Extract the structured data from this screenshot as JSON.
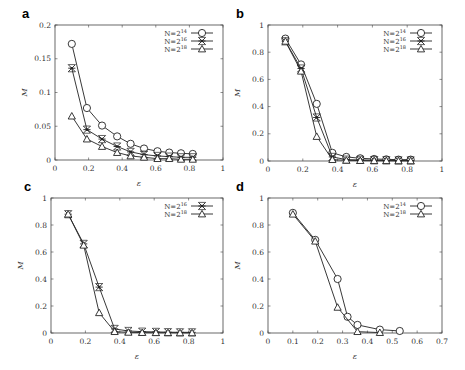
{
  "chart_data": [
    {
      "panel": "a",
      "type": "line",
      "xlabel": "ε",
      "ylabel": "M",
      "xlim": [
        0,
        1
      ],
      "ylim": [
        0,
        0.2
      ],
      "xticks": [
        "0",
        "0.2",
        "0.4",
        "0.6",
        "0.8",
        "1"
      ],
      "yticks": [
        "0",
        "0.05",
        "0.1",
        "0.15",
        "0.2"
      ],
      "legend_position": "top-right",
      "x": [
        0.1,
        0.19,
        0.28,
        0.37,
        0.45,
        0.53,
        0.61,
        0.68,
        0.75,
        0.82
      ],
      "series": [
        {
          "name": "N=2^14",
          "marker": "circle",
          "values": [
            0.172,
            0.077,
            0.051,
            0.035,
            0.024,
            0.017,
            0.013,
            0.011,
            0.01,
            0.009
          ]
        },
        {
          "name": "N=2^16",
          "marker": "asterisk",
          "values": [
            0.136,
            0.045,
            0.031,
            0.02,
            0.012,
            0.008,
            0.006,
            0.005,
            0.004,
            0.004
          ]
        },
        {
          "name": "N=2^18",
          "marker": "triangle",
          "values": [
            0.065,
            0.031,
            0.02,
            0.011,
            0.006,
            0.004,
            0.002,
            0.002,
            0.001,
            0.001
          ]
        }
      ]
    },
    {
      "panel": "b",
      "type": "line",
      "xlabel": "ε",
      "ylabel": "M",
      "xlim": [
        0,
        1
      ],
      "ylim": [
        0,
        1
      ],
      "xticks": [
        "0",
        "0.2",
        "0.4",
        "0.6",
        "0.8",
        "1"
      ],
      "yticks": [
        "0",
        "0.2",
        "0.4",
        "0.6",
        "0.8",
        "1"
      ],
      "legend_position": "top-right",
      "x": [
        0.1,
        0.19,
        0.28,
        0.37,
        0.45,
        0.53,
        0.61,
        0.68,
        0.75,
        0.82
      ],
      "series": [
        {
          "name": "N=2^14",
          "marker": "circle",
          "values": [
            0.9,
            0.71,
            0.42,
            0.06,
            0.03,
            0.02,
            0.015,
            0.012,
            0.01,
            0.01
          ]
        },
        {
          "name": "N=2^16",
          "marker": "asterisk",
          "values": [
            0.88,
            0.68,
            0.32,
            0.03,
            0.01,
            0.008,
            0.006,
            0.005,
            0.004,
            0.004
          ]
        },
        {
          "name": "N=2^18",
          "marker": "triangle",
          "values": [
            0.88,
            0.66,
            0.18,
            0.01,
            0.005,
            0.003,
            0.002,
            0.002,
            0.001,
            0.001
          ]
        }
      ]
    },
    {
      "panel": "c",
      "type": "line",
      "xlabel": "ε",
      "ylabel": "M",
      "xlim": [
        0,
        1
      ],
      "ylim": [
        0,
        1
      ],
      "xticks": [
        "0",
        "0.2",
        "0.4",
        "0.6",
        "0.8",
        "1"
      ],
      "yticks": [
        "0",
        "0.2",
        "0.4",
        "0.6",
        "0.8",
        "1"
      ],
      "legend_position": "top-right",
      "x": [
        0.1,
        0.19,
        0.28,
        0.37,
        0.45,
        0.53,
        0.61,
        0.68,
        0.75,
        0.82
      ],
      "series": [
        {
          "name": "N=2^16",
          "marker": "asterisk",
          "values": [
            0.88,
            0.66,
            0.34,
            0.03,
            0.015,
            0.01,
            0.008,
            0.006,
            0.005,
            0.005
          ]
        },
        {
          "name": "N=2^18",
          "marker": "triangle",
          "values": [
            0.88,
            0.65,
            0.15,
            0.01,
            0.005,
            0.003,
            0.002,
            0.002,
            0.001,
            0.001
          ]
        }
      ]
    },
    {
      "panel": "d",
      "type": "line",
      "xlabel": "ε",
      "ylabel": "M",
      "xlim": [
        0,
        0.7
      ],
      "ylim": [
        0,
        1
      ],
      "xticks": [
        "0",
        "0.1",
        "0.2",
        "0.3",
        "0.4",
        "0.5",
        "0.6",
        "0.7"
      ],
      "yticks": [
        "0",
        "0.2",
        "0.4",
        "0.6",
        "0.8",
        "1"
      ],
      "legend_position": "top-right",
      "series": [
        {
          "name": "N=2^14",
          "marker": "circle",
          "x": [
            0.1,
            0.19,
            0.28,
            0.32,
            0.36,
            0.45,
            0.53
          ],
          "values": [
            0.89,
            0.69,
            0.4,
            0.12,
            0.06,
            0.025,
            0.015
          ]
        },
        {
          "name": "N=2^18",
          "marker": "triangle",
          "x": [
            0.1,
            0.19,
            0.28,
            0.36,
            0.45
          ],
          "values": [
            0.88,
            0.68,
            0.19,
            0.01,
            0.003
          ]
        }
      ]
    }
  ],
  "panels": [
    {
      "label": "a",
      "legend": [
        "N=2",
        "N=2",
        "N=2"
      ],
      "legend_exp": [
        "14",
        "16",
        "18"
      ]
    },
    {
      "label": "b",
      "legend": [
        "N=2",
        "N=2",
        "N=2"
      ],
      "legend_exp": [
        "14",
        "16",
        "18"
      ]
    },
    {
      "label": "c",
      "legend": [
        "N=2",
        "N=2"
      ],
      "legend_exp": [
        "16",
        "18"
      ]
    },
    {
      "label": "d",
      "legend": [
        "N=2",
        "N=2"
      ],
      "legend_exp": [
        "14",
        "18"
      ]
    }
  ],
  "axis": {
    "xlabel": "ε",
    "ylabel": "M"
  }
}
